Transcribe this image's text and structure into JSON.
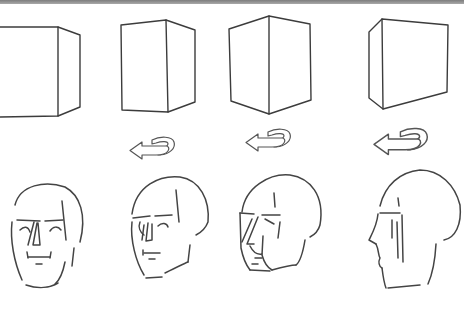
{
  "illustration": {
    "subject": "Rotation sequence of a box and a head, turning from frontal to profile view",
    "colors": {
      "background": "#ffffff",
      "line": "#3c3c3c",
      "top_bar": "#8a8a8a"
    },
    "boxes": [
      {
        "id": "box-1",
        "view": "front-right",
        "paths": [
          "M0,27 L58,27 L58,116 L0,117",
          "M58,27 L80,35 L80,107 L58,116"
        ]
      },
      {
        "id": "box-2",
        "view": "three-quarter-right",
        "paths": [
          "M121,25 L166,20 L168,112 L122,110 Z",
          "M166,20 L195,30 L195,102 L168,112"
        ]
      },
      {
        "id": "box-3",
        "view": "corner",
        "paths": [
          "M229,29 L269,16 L310,24 L311,100 L269,114 L231,101 Z",
          "M269,16 L269,114"
        ]
      },
      {
        "id": "box-4",
        "view": "front-left",
        "paths": [
          "M369,32 L382,19 L448,25 L447,92 L383,109 L369,98 Z",
          "M382,19 L383,109"
        ]
      }
    ],
    "rotation_arrows": [
      {
        "id": "arrow-1",
        "direction": "left",
        "icon": "rotate-left-arrow-icon",
        "transform": "translate(130,136)"
      },
      {
        "id": "arrow-2",
        "direction": "left",
        "icon": "rotate-left-arrow-icon",
        "transform": "translate(246,128)"
      },
      {
        "id": "arrow-3",
        "direction": "left",
        "icon": "rotate-left-arrow-icon",
        "transform": "translate(374,127) scale(1.2)"
      }
    ],
    "heads": [
      {
        "id": "head-1",
        "view": "front",
        "paths": [
          "M15,205 C20,185 45,180 65,187 C80,195 87,215 80,242",
          "M12,222 C10,240 14,262 22,280",
          "M26,285 C38,289 50,288 58,283",
          "M65,262 C63,272 60,280 55,284",
          "M62,201 L66,240",
          "M74,248 L72,266",
          "M17,220 L40,221",
          "M45,221 L63,220",
          "M20,230 C24,226 28,226 30,232",
          "M50,231 C53,226 58,226 61,230",
          "M34,222 L28,245",
          "M37,223 L33,245 L40,245 L38,223",
          "M28,257 L50,257",
          "M27,252 L28,258",
          "M51,252 L50,258",
          "M36,264 L42,264"
        ]
      },
      {
        "id": "head-2",
        "view": "three-quarter",
        "paths": [
          "M132,214 C136,185 160,175 180,177 C200,180 210,200 208,222 C205,230 200,233 196,235",
          "M132,222 C130,240 136,262 144,275",
          "M146,278 L162,277",
          "M190,245 L188,262",
          "M165,273 C175,268 183,264 188,262",
          "M176,190 L179,222",
          "M133,218 L150,216",
          "M155,216 L172,215",
          "M144,225 L142,240",
          "M148,223 L146,241 L152,240 L152,224",
          "M140,222 C138,227 140,232 144,235",
          "M158,226 C162,222 167,223 168,227",
          "M144,253 L160,253",
          "M143,250 L143,255",
          "M149,259 L155,259"
        ]
      },
      {
        "id": "head-3",
        "view": "three-quarter-turned",
        "paths": [
          "M242,212 C245,187 270,173 290,175 C310,178 325,195 320,225 C318,232 314,235 310,237",
          "M240,213 L241,248 C243,258 246,265 250,270",
          "M250,270 L270,271",
          "M305,240 C303,252 300,262 296,265",
          "M272,270 C283,267 293,265 296,265",
          "M274,193 L275,207",
          "M240,213 L254,214",
          "M262,215 L280,215",
          "M252,219 L242,242",
          "M258,217 L247,244 L254,244",
          "M250,246 C253,252 257,255 262,254",
          "M265,219 L274,224",
          "M263,236 L262,255 C264,262 268,268 272,270",
          "M280,222 L278,238",
          "M255,258 L262,258",
          "M252,264 L258,264"
        ]
      },
      {
        "id": "head-4",
        "view": "profile",
        "paths": [
          "M380,206 C385,185 400,172 420,170 C440,170 455,185 460,205 C462,225 455,238 444,240",
          "M378,214 C377,225 373,232 369,240 L376,244",
          "M376,244 C379,250 378,255 380,258 C378,262 379,266 382,268",
          "M382,268 C383,276 384,283 386,288",
          "M388,288 L420,285",
          "M436,244 C435,262 432,275 428,284",
          "M380,213 L400,213",
          "M392,220 L392,238",
          "M397,222 L398,258",
          "M402,215 L403,262",
          "M398,198 L399,206"
        ]
      }
    ]
  }
}
